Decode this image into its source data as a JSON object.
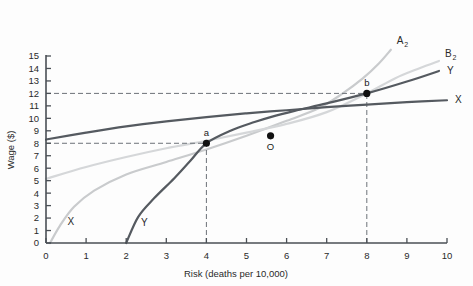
{
  "chart_data": {
    "type": "line",
    "title": "",
    "xlabel": "Risk (deaths per 10,000)",
    "ylabel": "Wage ($)",
    "xlim": [
      0,
      10
    ],
    "ylim": [
      0,
      15
    ],
    "xticks": [
      "0",
      "1",
      "2",
      "3",
      "4",
      "5",
      "6",
      "7",
      "8",
      "9",
      "10"
    ],
    "yticks": [
      "0",
      "1",
      "2",
      "3",
      "4",
      "5",
      "6",
      "7",
      "8",
      "9",
      "10",
      "11",
      "12",
      "13",
      "14",
      "15"
    ],
    "grid": false,
    "legend": "none",
    "series": [
      {
        "name": "X",
        "role": "wage-offer-curve-firm-x",
        "color": "#555a60",
        "style": "solid",
        "width": 2.2,
        "label_right": "X",
        "label_left": "X",
        "points": [
          [
            0,
            8.3
          ],
          [
            1,
            8.85
          ],
          [
            2,
            9.35
          ],
          [
            3,
            9.75
          ],
          [
            4,
            10.1
          ],
          [
            5,
            10.4
          ],
          [
            6,
            10.65
          ],
          [
            7,
            10.9
          ],
          [
            8,
            11.1
          ],
          [
            9,
            11.3
          ],
          [
            10,
            11.45
          ]
        ]
      },
      {
        "name": "Y",
        "role": "wage-offer-curve-firm-y",
        "color": "#555a60",
        "style": "solid",
        "width": 2.2,
        "label_right": "Y",
        "label_left": "Y",
        "points": [
          [
            2,
            0
          ],
          [
            2.3,
            2.1
          ],
          [
            2.7,
            3.6
          ],
          [
            3.2,
            5.2
          ],
          [
            3.6,
            6.6
          ],
          [
            4,
            8.0
          ],
          [
            4.6,
            9.0
          ],
          [
            5.2,
            9.7
          ],
          [
            5.6,
            10.1
          ],
          [
            6.2,
            10.6
          ],
          [
            7,
            11.2
          ],
          [
            8,
            12.0
          ],
          [
            9,
            12.95
          ],
          [
            9.8,
            13.8
          ]
        ]
      },
      {
        "name": "A2",
        "role": "indifference-curve-A2",
        "color": "#c9cbcd",
        "style": "solid",
        "width": 2.2,
        "label_right": "A₂",
        "points": [
          [
            0.1,
            0
          ],
          [
            0.35,
            1.4
          ],
          [
            0.7,
            2.9
          ],
          [
            1.2,
            4.2
          ],
          [
            2,
            5.5
          ],
          [
            3,
            6.5
          ],
          [
            4,
            7.5
          ],
          [
            5,
            8.6
          ],
          [
            6,
            9.8
          ],
          [
            6.8,
            10.8
          ],
          [
            7.4,
            12.0
          ],
          [
            7.9,
            13.2
          ],
          [
            8.3,
            14.4
          ],
          [
            8.6,
            15.5
          ]
        ]
      },
      {
        "name": "B2",
        "role": "indifference-curve-B2",
        "color": "#d5d7d9",
        "style": "solid",
        "width": 2.2,
        "label_right": "B₂",
        "points": [
          [
            0,
            5.15
          ],
          [
            1,
            6.1
          ],
          [
            2,
            6.9
          ],
          [
            3,
            7.6
          ],
          [
            4,
            8.2
          ],
          [
            5,
            8.85
          ],
          [
            6,
            9.55
          ],
          [
            7,
            10.5
          ],
          [
            8,
            12.0
          ],
          [
            8.7,
            13.2
          ],
          [
            9.3,
            14.0
          ],
          [
            9.8,
            14.6
          ]
        ]
      }
    ],
    "points": [
      {
        "label": "a",
        "x": 4,
        "y": 8.0,
        "label_pos": "above"
      },
      {
        "label": "O",
        "x": 5.6,
        "y": 8.6,
        "label_pos": "below"
      },
      {
        "label": "b",
        "x": 8,
        "y": 12.0,
        "label_pos": "above"
      }
    ],
    "guide_lines": [
      {
        "type": "horizontal",
        "value": 12,
        "from_x": 0,
        "to_x": 8,
        "style": "dashed"
      },
      {
        "type": "horizontal",
        "value": 8,
        "from_x": 0,
        "to_x": 4,
        "style": "dashed"
      },
      {
        "type": "vertical",
        "value": 4,
        "from_y": 0,
        "to_y": 8,
        "style": "dashed"
      },
      {
        "type": "vertical",
        "value": 8,
        "from_y": 0,
        "to_y": 12,
        "style": "dashed"
      }
    ],
    "annotations": [
      {
        "text": "X",
        "x": 0.62,
        "y": 1.45,
        "name": "curve-label-x-lower-left"
      },
      {
        "text": "Y",
        "x": 2.45,
        "y": 1.35,
        "name": "curve-label-y-lower-left"
      }
    ],
    "colors": {
      "axis": "#4a4f55",
      "dark_curve": "#555a60",
      "light_curve": "#cdcfd1",
      "dash": "#6d7278",
      "marker": "#111111",
      "background": "#fdfdfd"
    }
  }
}
